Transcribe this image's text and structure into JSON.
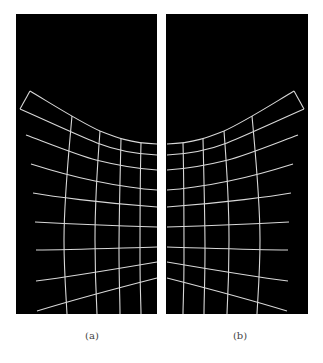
{
  "figure": {
    "panels": [
      {
        "id": "a",
        "caption": "(a)",
        "rect": {
          "x": 16,
          "y": 14,
          "w": 141,
          "h": 300
        },
        "description": "Distorted grid, horizontal lines converging toward the right edge"
      },
      {
        "id": "b",
        "caption": "(b)",
        "rect": {
          "x": 166,
          "y": 14,
          "w": 142,
          "h": 300
        },
        "description": "Mirror-image distorted grid, horizontal lines converging toward the left edge"
      }
    ],
    "colors": {
      "panel_background": "#000000",
      "grid_line": "#d8d8d8",
      "page_background": "#ffffff",
      "caption_text": "#444444"
    }
  }
}
